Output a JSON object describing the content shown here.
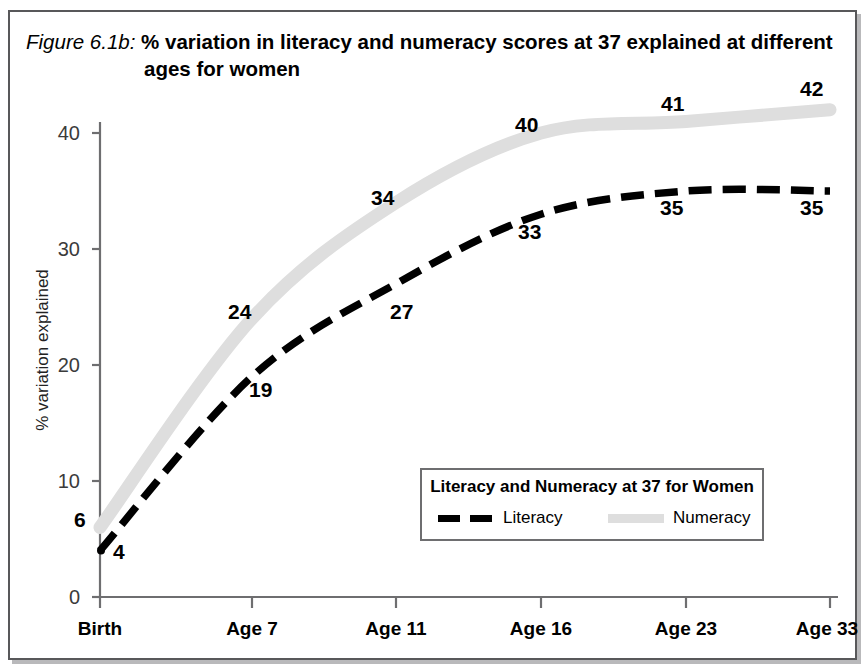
{
  "figure": {
    "title_prefix": "Figure 6.1b:",
    "title_main": " % variation in literacy and numeracy scores at 37 explained at different",
    "title_line2": "ages for women"
  },
  "legend": {
    "title": "Literacy and Numeracy at 37 for Women",
    "entries": [
      {
        "label": "Literacy",
        "color": "#000000",
        "style": "dashed"
      },
      {
        "label": "Numeracy",
        "color": "#dedede",
        "style": "solid"
      }
    ]
  },
  "axes": {
    "ylabel": "% variation explained",
    "yticks": [
      "0",
      "10",
      "20",
      "30",
      "40"
    ],
    "xticks": [
      "Birth",
      "Age 7",
      "Age 11",
      "Age 16",
      "Age 23",
      "Age 33"
    ]
  },
  "labels": {
    "numeracy": [
      "6",
      "24",
      "34",
      "40",
      "41",
      "42"
    ],
    "literacy": [
      "4",
      "19",
      "27",
      "33",
      "35",
      "35"
    ]
  },
  "chart_data": {
    "type": "line",
    "title": "Figure 6.1b: % variation in literacy and numeracy scores at 37 explained at different ages for women",
    "xlabel": "",
    "ylabel": "% variation explained",
    "categories": [
      "Birth",
      "Age 7",
      "Age 11",
      "Age 16",
      "Age 23",
      "Age 33"
    ],
    "series": [
      {
        "name": "Literacy",
        "values": [
          4,
          19,
          27,
          33,
          35,
          35
        ],
        "color": "#000000",
        "style": "dashed"
      },
      {
        "name": "Numeracy",
        "values": [
          6,
          24,
          34,
          40,
          41,
          42
        ],
        "color": "#dedede",
        "style": "solid"
      }
    ],
    "ylim": [
      0,
      44
    ],
    "yticks": [
      0,
      10,
      20,
      30,
      40
    ],
    "grid": false,
    "legend_position": "inside-bottom-right",
    "legend_title": "Literacy and Numeracy at 37 for Women"
  }
}
